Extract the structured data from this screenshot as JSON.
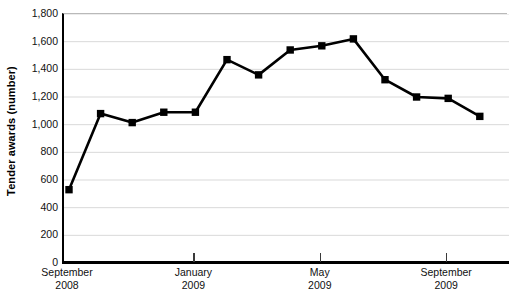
{
  "chart_data": {
    "type": "line",
    "title": "",
    "xlabel": "",
    "ylabel": "Tender awards (number)",
    "ylim": [
      0,
      1800
    ],
    "ytick_step": 200,
    "grid": true,
    "legend": "none",
    "marker": "filled-square",
    "line_color": "#000000",
    "marker_color": "#000000",
    "grid_color": "#d9d9d9",
    "axis_color": "#000000",
    "y_tick_labels": [
      "1,800",
      "1,600",
      "1,400",
      "1,200",
      "1,000",
      "800",
      "600",
      "400",
      "200",
      "0"
    ],
    "y_tick_values": [
      1800,
      1600,
      1400,
      1200,
      1000,
      800,
      600,
      400,
      200,
      0
    ],
    "x_tick_labels": [
      {
        "month": "September",
        "year": "2008",
        "index": 0
      },
      {
        "month": "January",
        "year": "2009",
        "index": 4
      },
      {
        "month": "May",
        "year": "2009",
        "index": 8
      },
      {
        "month": "September",
        "year": "2009",
        "index": 12
      }
    ],
    "x": [
      "September 2008",
      "October 2008",
      "November 2008",
      "December 2008",
      "January 2009",
      "February 2009",
      "March 2009",
      "April 2009",
      "May 2009",
      "June 2009",
      "July 2009",
      "August 2009",
      "September 2009",
      "October 2009"
    ],
    "values": [
      530,
      1080,
      1015,
      1090,
      1090,
      1470,
      1360,
      1540,
      1570,
      1620,
      1325,
      1200,
      1190,
      1060
    ]
  }
}
